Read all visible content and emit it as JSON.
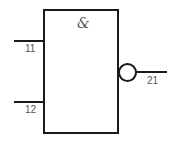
{
  "gate": {
    "type": "NAND",
    "symbol": "&",
    "inputs": [
      {
        "label": "11"
      },
      {
        "label": "12"
      }
    ],
    "output": {
      "label": "21",
      "inverted": true
    }
  },
  "colors": {
    "stroke": "#1a1a1a",
    "text": "#555555",
    "background": "#ffffff"
  }
}
